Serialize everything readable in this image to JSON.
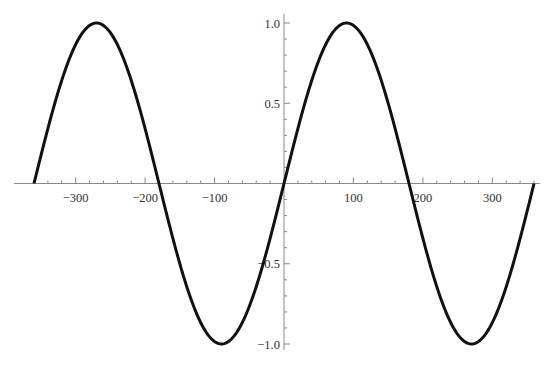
{
  "chart_data": {
    "type": "line",
    "title": "",
    "xlabel": "",
    "ylabel": "",
    "function": "sin(x degrees)",
    "xlim": [
      -360,
      360
    ],
    "ylim": [
      -1.0,
      1.0
    ],
    "grid": false,
    "legend": null,
    "x_ticks": [
      -300,
      -200,
      -100,
      100,
      200,
      300
    ],
    "x_tick_labels": [
      "−300",
      "−200",
      "−100",
      "100",
      "200",
      "300"
    ],
    "y_ticks": [
      1.0,
      0.5,
      -0.5,
      -1.0
    ],
    "y_tick_labels": [
      "1.0",
      "0.5",
      "−0.5",
      "−1.0"
    ],
    "series": [
      {
        "name": "sin(x)",
        "color": "#111111",
        "x": [
          -360,
          -315,
          -270,
          -225,
          -180,
          -135,
          -90,
          -45,
          0,
          45,
          90,
          135,
          180,
          225,
          270,
          315,
          360
        ],
        "y": [
          0,
          0.707,
          1,
          0.707,
          0,
          -0.707,
          -1,
          -0.707,
          0,
          0.707,
          1,
          0.707,
          0,
          -0.707,
          -1,
          -0.707,
          0
        ]
      }
    ]
  },
  "layout": {
    "origin_px": [
      284,
      183.5
    ],
    "px_per_x_unit": 0.6945,
    "px_per_y_unit": 160.5,
    "x_axis_px": [
      14,
      540
    ],
    "y_axis_px": [
      14,
      350
    ],
    "minor_x_step": 20,
    "minor_y_step": 0.1
  }
}
